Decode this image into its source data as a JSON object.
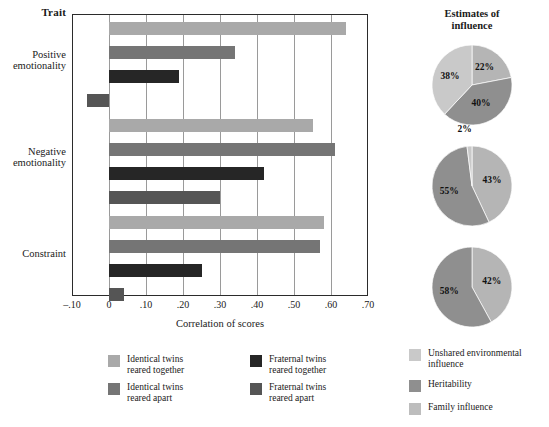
{
  "chart_data": [
    {
      "type": "bar",
      "title": "Trait",
      "xlabel": "Correlation of scores",
      "ylabel": "Trait",
      "orientation": "horizontal",
      "xlim": [
        -0.1,
        0.7
      ],
      "xticks": [
        "–.10",
        "0",
        ".10",
        ".20",
        ".30",
        ".40",
        ".50",
        ".60",
        ".70"
      ],
      "xtick_values": [
        -0.1,
        0,
        0.1,
        0.2,
        0.3,
        0.4,
        0.5,
        0.6,
        0.7
      ],
      "grid": true,
      "legend_position": "below",
      "categories": [
        "Positive emotionality",
        "Negative emotionality",
        "Constraint"
      ],
      "series": [
        {
          "name": "Identical twins reared together",
          "color": "#a9a9a9",
          "values": [
            0.64,
            0.55,
            0.58
          ]
        },
        {
          "name": "Identical twins reared apart",
          "color": "#757575",
          "values": [
            0.34,
            0.61,
            0.57
          ]
        },
        {
          "name": "Fraternal twins reared together",
          "color": "#262626",
          "values": [
            0.19,
            0.42,
            0.25
          ]
        },
        {
          "name": "Fraternal twins reared apart",
          "color": "#555555",
          "values": [
            -0.06,
            0.3,
            0.04
          ]
        }
      ]
    },
    {
      "type": "pie",
      "title": "Estimates of influence",
      "legend_position": "below",
      "pies": [
        {
          "for_category": "Positive emotionality",
          "labels": [
            "Unshared environmental influence",
            "Heritability",
            "Family influence"
          ],
          "values": [
            22,
            40,
            38
          ],
          "display": [
            "22%",
            "40%",
            "38%"
          ],
          "colors": [
            "#b5b5b5",
            "#8f8f8f",
            "#c9c9c9"
          ]
        },
        {
          "for_category": "Negative emotionality",
          "labels": [
            "Unshared environmental influence",
            "Heritability",
            "Family influence"
          ],
          "values": [
            43,
            55,
            2
          ],
          "display": [
            "43%",
            "55%",
            "2%"
          ],
          "colors": [
            "#b5b5b5",
            "#8f8f8f",
            "#c9c9c9"
          ]
        },
        {
          "for_category": "Constraint",
          "labels": [
            "Unshared environmental influence",
            "Heritability",
            "Family influence"
          ],
          "values": [
            42,
            58,
            0
          ],
          "display": [
            "42%",
            "58%",
            ""
          ],
          "colors": [
            "#b5b5b5",
            "#8f8f8f",
            "#c9c9c9"
          ]
        }
      ],
      "legend": [
        {
          "label": "Unshared environmental influence",
          "color": "#c9c9c9"
        },
        {
          "label": "Heritability",
          "color": "#8f8f8f"
        },
        {
          "label": "Family influence",
          "color": "#bdbdbd"
        }
      ]
    }
  ],
  "bar_chart": {
    "trait_heading": "Trait",
    "xaxis_title": "Correlation of scores",
    "xticks": [
      "–.10",
      "0",
      ".10",
      ".20",
      ".30",
      ".40",
      ".50",
      ".60",
      ".70"
    ],
    "categories": [
      {
        "line1": "Positive",
        "line2": "emotionality"
      },
      {
        "line1": "Negative",
        "line2": "emotionality"
      },
      {
        "line1": "Constraint",
        "line2": ""
      }
    ],
    "legend": [
      {
        "line1": "Identical twins",
        "line2": "reared together",
        "color": "#a9a9a9"
      },
      {
        "line1": "Fraternal twins",
        "line2": "reared together",
        "color": "#262626"
      },
      {
        "line1": "Identical twins",
        "line2": "reared apart",
        "color": "#757575"
      },
      {
        "line1": "Fraternal twins",
        "line2": "reared apart",
        "color": "#555555"
      }
    ]
  },
  "pie_chart": {
    "heading_line1": "Estimates of",
    "heading_line2": "influence",
    "legend": [
      {
        "label": "Unshared environmental influence",
        "color": "#c9c9c9"
      },
      {
        "label": "Heritability",
        "color": "#8f8f8f"
      },
      {
        "label": "Family influence",
        "color": "#bdbdbd"
      }
    ]
  }
}
